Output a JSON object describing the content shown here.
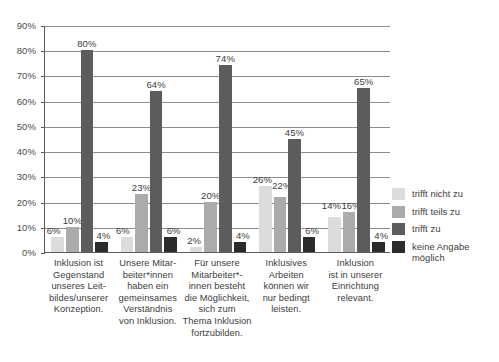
{
  "chart_data": {
    "type": "bar",
    "title": "",
    "xlabel": "",
    "ylabel": "",
    "ylim": [
      0,
      90
    ],
    "grid": true,
    "legend_position": "right",
    "ytick_labels": [
      "90%",
      "80%",
      "70%",
      "60%",
      "50%",
      "40%",
      "30%",
      "20%",
      "10%",
      "0%"
    ],
    "ytick_values": [
      90,
      80,
      70,
      60,
      50,
      40,
      30,
      20,
      10,
      0
    ],
    "categories": [
      "Inklusion ist Gegenstand unseres Leitbildes/unserer Konzeption.",
      "Unsere Mitarbeiter*innen haben ein gemeinsames Verständnis von Inklusion.",
      "Für unsere Mitarbeiter*innen besteht die Möglichkeit, sich zum Thema Inklusion fortzubilden.",
      "Inklusives Arbeiten können wir nur bedingt leisten.",
      "Inklusion ist in unserer Einrichtung relevant."
    ],
    "category_lines": [
      [
        "Inklusion ist",
        "Gegenstand",
        "unseres Leit-",
        "bildes/unserer",
        "Konzeption."
      ],
      [
        "Unsere Mitar-",
        "beiter*innen",
        "haben ein",
        "gemeinsames",
        "Verständnis",
        "von Inklusion."
      ],
      [
        "Für unsere",
        "Mitarbeiter*-",
        "innen besteht",
        "die Möglichkeit,",
        "sich zum",
        "Thema Inklusion",
        "fortzubilden."
      ],
      [
        "Inklusives",
        "Arbeiten",
        "können wir",
        "nur bedingt",
        "leisten."
      ],
      [
        "Inklusion",
        "ist in unserer",
        "Einrichtung",
        "relevant."
      ]
    ],
    "series": [
      {
        "name": "trifft nicht zu",
        "color": "#dcdcdc",
        "values": [
          6,
          6,
          2,
          26,
          14
        ],
        "labels": [
          "6%",
          "6%",
          "2%",
          "26%",
          "14%"
        ]
      },
      {
        "name": "trifft teils zu",
        "color": "#ababab",
        "values": [
          10,
          23,
          20,
          22,
          16
        ],
        "labels": [
          "10%",
          "23%",
          "20%",
          "22%",
          "16%"
        ]
      },
      {
        "name": "trifft zu",
        "color": "#5c5c5c",
        "values": [
          80,
          64,
          74,
          45,
          65
        ],
        "labels": [
          "80%",
          "64%",
          "74%",
          "45%",
          "65%"
        ]
      },
      {
        "name": "keine Angabe möglich",
        "color": "#2b2b2b",
        "values": [
          4,
          6,
          4,
          6,
          4
        ],
        "labels": [
          "4%",
          "6%",
          "4%",
          "6%",
          "4%"
        ]
      }
    ],
    "legend_entries": [
      {
        "label": "trifft nicht zu",
        "color": "#dcdcdc"
      },
      {
        "label": "trifft teils zu",
        "color": "#ababab"
      },
      {
        "label": "trifft zu",
        "color": "#5c5c5c"
      },
      {
        "label": "keine Angabe möglich",
        "color": "#2b2b2b"
      }
    ],
    "legend_lines": [
      [
        "trifft nicht zu"
      ],
      [
        "trifft teils zu"
      ],
      [
        "trifft zu"
      ],
      [
        "keine Angabe",
        "möglich"
      ]
    ],
    "axis_color": "#5a5a5a",
    "grid_color": "#8e8e8e",
    "background": "#ffffff"
  }
}
